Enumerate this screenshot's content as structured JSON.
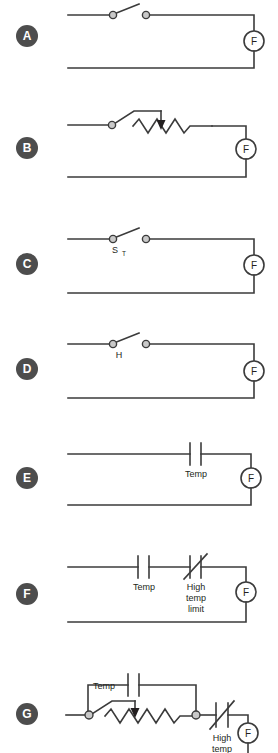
{
  "diagram": {
    "line_color": "#3b3b3b",
    "badge_color": "#4d4d4d",
    "badge_text_color": "#ffffff",
    "background": "#ffffff",
    "load_label": "F",
    "panels": [
      {
        "id": "A",
        "badge": "A",
        "switch_label": "",
        "components": [
          "switch"
        ],
        "load": "F"
      },
      {
        "id": "B",
        "badge": "B",
        "switch_label": "",
        "components": [
          "switch",
          "rheostat"
        ],
        "load": "F"
      },
      {
        "id": "C",
        "badge": "C",
        "switch_label": "S",
        "switch_label_sub": "T",
        "components": [
          "switch"
        ],
        "load": "F"
      },
      {
        "id": "D",
        "badge": "D",
        "switch_label": "H",
        "components": [
          "switch"
        ],
        "load": "F"
      },
      {
        "id": "E",
        "badge": "E",
        "contact_label": "Temp",
        "components": [
          "contact"
        ],
        "load": "F"
      },
      {
        "id": "F",
        "badge": "F",
        "contact_label": "Temp",
        "limit_label_line1": "High",
        "limit_label_line2": "temp",
        "limit_label_line3": "limit",
        "components": [
          "contact",
          "nc-contact"
        ],
        "load": "F"
      },
      {
        "id": "G",
        "badge": "G",
        "contact_label": "Temp",
        "limit_label_line1": "High",
        "limit_label_line2": "temp",
        "components": [
          "contact-bypass",
          "rheostat",
          "nc-contact"
        ],
        "load": "F"
      }
    ]
  }
}
